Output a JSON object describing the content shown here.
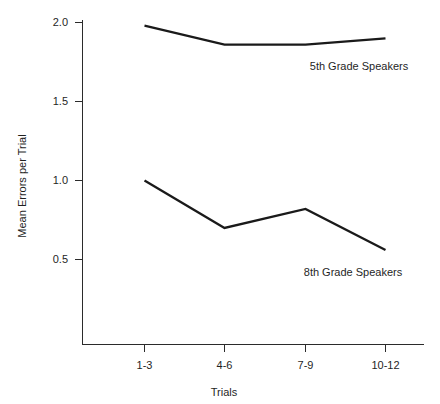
{
  "chart_data": {
    "type": "line",
    "title": "",
    "xlabel": "Trials",
    "ylabel": "Mean Errors per Trial",
    "categories": [
      "1-3",
      "4-6",
      "7-9",
      "10-12"
    ],
    "series": [
      {
        "name": "5th Grade Speakers",
        "values": [
          1.98,
          1.86,
          1.86,
          1.9
        ],
        "label_text": "5th Grade Speakers"
      },
      {
        "name": "8th Grade Speakers",
        "values": [
          1.0,
          0.7,
          0.82,
          0.56
        ],
        "label_text": "8th Grade Speakers"
      }
    ],
    "yticks": [
      "0.5",
      "1.0",
      "1.5",
      "2.0"
    ],
    "ytick_values": [
      0.5,
      1.0,
      1.5,
      2.0
    ],
    "ylim": [
      0.0,
      2.08
    ],
    "xlim": [
      0,
      5
    ],
    "grid": false,
    "legend_position": "inline-annotation",
    "line_color": "#1a1a1a",
    "axis_color": "#2b2b2b",
    "background_color": "#ffffff"
  },
  "axes": {
    "y_axis_title": "Mean Errors per Trial",
    "x_axis_title": "Trials",
    "y_tick_labels": [
      "2.0",
      "1.5",
      "1.0",
      "0.5"
    ],
    "x_tick_labels": [
      "1-3",
      "4-6",
      "7-9",
      "10-12"
    ]
  },
  "annotations": {
    "series_1_label": "5th Grade Speakers",
    "series_2_label": "8th Grade Speakers"
  }
}
